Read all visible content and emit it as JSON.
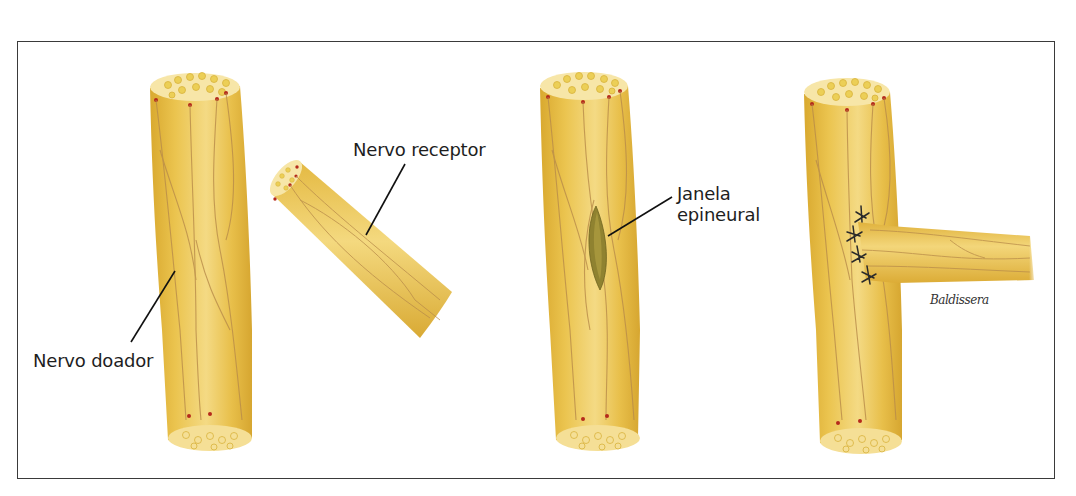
{
  "figure": {
    "colors": {
      "frame": "#3a3a3a",
      "nerve_fill": "#e9c24e",
      "nerve_light": "#f3d980",
      "nerve_shade": "#d4a52e",
      "vessel": "#b98c4a",
      "fascicle": "#efd65e",
      "cut_surface": "#f7e6a8",
      "vessel_dot": "#b52a1c",
      "window": "#8f8230",
      "suture": "#2a2a2a",
      "leader_line": "#111111",
      "text": "#1e1e1e"
    },
    "panels": [
      {
        "id": "panel-1",
        "labels": {
          "donor": "Nervo doador",
          "recipient": "Nervo receptor"
        }
      },
      {
        "id": "panel-2",
        "labels": {
          "window_line1": "Janela",
          "window_line2": "epineural"
        }
      },
      {
        "id": "panel-3",
        "suture_count": 4,
        "signature": "Baldissera"
      }
    ]
  }
}
